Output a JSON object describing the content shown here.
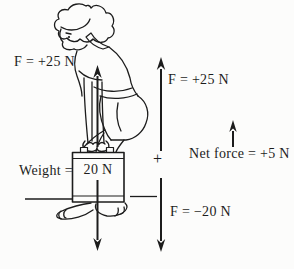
{
  "diagram": {
    "labels": {
      "force_left": "F = +25 N",
      "force_right": "F = +25 N",
      "weight": "Weight =",
      "box_value": "20 N",
      "plus": "+",
      "net_force": "Net force = +5 N",
      "force_down": "F = −20 N"
    },
    "arrows": {
      "lift_force_person": "up",
      "weight_force_box": "down",
      "applied_force_right": "up",
      "opposing_force_right": "down",
      "net_force_arrow": "up"
    },
    "colors": {
      "background": "#fcfcfb",
      "ink": "#1c1c1c"
    }
  }
}
